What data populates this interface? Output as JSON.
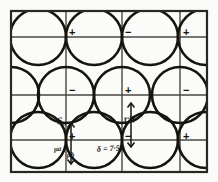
{
  "figure": {
    "frame": {
      "x": 11,
      "y": 11,
      "width": 196,
      "height": 161
    },
    "ink_color": "#16140f",
    "grid_color": "#4a4742",
    "paper_color": "#fbfbf9",
    "grid": {
      "vertical_lines": [
        11,
        66,
        122,
        180,
        207
      ],
      "horizontal_lines": [
        11,
        37,
        95,
        140,
        172
      ]
    },
    "circles": {
      "radius": 28,
      "centers": [
        {
          "cx": 38,
          "cy": 37
        },
        {
          "cx": 94,
          "cy": 37
        },
        {
          "cx": 150,
          "cy": 37
        },
        {
          "cx": 206,
          "cy": 37
        },
        {
          "cx": 11,
          "cy": 95
        },
        {
          "cx": 66,
          "cy": 95
        },
        {
          "cx": 122,
          "cy": 95
        },
        {
          "cx": 180,
          "cy": 95
        },
        {
          "cx": 38,
          "cy": 140
        },
        {
          "cx": 94,
          "cy": 140
        },
        {
          "cx": 150,
          "cy": 140
        },
        {
          "cx": 206,
          "cy": 140
        }
      ]
    },
    "signs": [
      {
        "label": "+",
        "x": 69,
        "y": 27
      },
      {
        "label": "−",
        "x": 125,
        "y": 27
      },
      {
        "label": "+",
        "x": 183,
        "y": 27
      },
      {
        "label": "−",
        "x": 69,
        "y": 85
      },
      {
        "label": "+",
        "x": 125,
        "y": 85
      },
      {
        "label": "−",
        "x": 183,
        "y": 85
      },
      {
        "label": "+",
        "x": 69,
        "y": 131
      },
      {
        "label": "−",
        "x": 125,
        "y": 131
      },
      {
        "label": "+",
        "x": 183,
        "y": 131
      }
    ],
    "annotations": {
      "s0": "S₀",
      "delta": "δ = 7·50",
      "r_eta": "r·η",
      "mu_a": "μa",
      "mu_b": "μb"
    },
    "arrows": [
      {
        "name": "mu-arrow",
        "x": 71,
        "y1": 124,
        "y2": 163
      },
      {
        "name": "r-eta-arrow",
        "x": 131,
        "y1": 104,
        "y2": 146
      }
    ]
  }
}
